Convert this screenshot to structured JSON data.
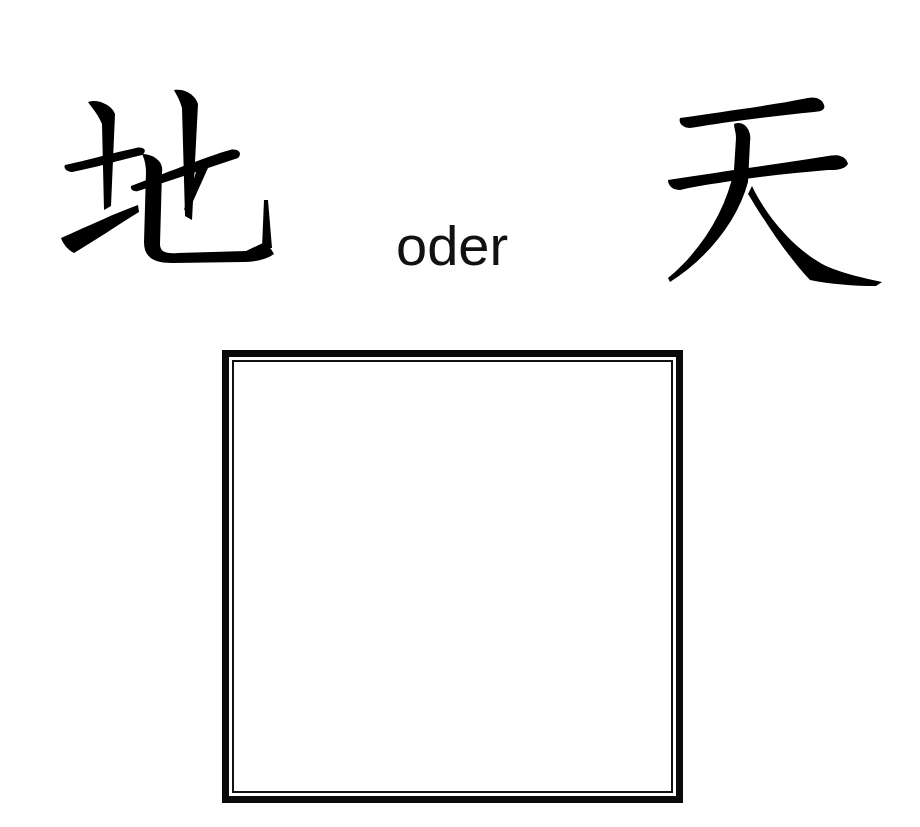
{
  "exercise": {
    "left_character": "地",
    "connector_word": "oder",
    "right_character": "天",
    "answer_box": {
      "content": ""
    }
  },
  "colors": {
    "text": "#000000",
    "frame": "#0a0a0a",
    "background": "#ffffff"
  }
}
